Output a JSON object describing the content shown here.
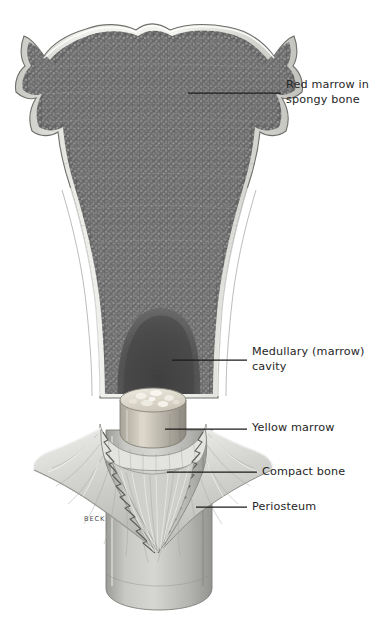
{
  "figure": {
    "background_color": "#ffffff",
    "label_color": "#262626",
    "leader_color": "#1a1a1a",
    "artist_signature": "BECK"
  },
  "labels": [
    {
      "id": "red-marrow",
      "text": "Red marrow in\nspongy bone",
      "x": 286,
      "y": 78,
      "leader": {
        "x1": 188,
        "y1": 93,
        "x2": 281,
        "y2": 93
      }
    },
    {
      "id": "medullary-cavity",
      "text": "Medullary (marrow)\ncavity",
      "x": 252,
      "y": 345,
      "leader": {
        "x1": 172,
        "y1": 360,
        "x2": 247,
        "y2": 360
      }
    },
    {
      "id": "yellow-marrow",
      "text": "Yellow marrow",
      "x": 252,
      "y": 421,
      "leader": {
        "x1": 165,
        "y1": 429,
        "x2": 247,
        "y2": 429
      }
    },
    {
      "id": "compact-bone",
      "text": "Compact bone",
      "x": 262,
      "y": 465,
      "leader": {
        "x1": 167,
        "y1": 472,
        "x2": 257,
        "y2": 472
      }
    },
    {
      "id": "periosteum",
      "text": "Periosteum",
      "x": 252,
      "y": 500,
      "leader": {
        "x1": 196,
        "y1": 507,
        "x2": 247,
        "y2": 507
      }
    }
  ],
  "anatomy": {
    "epiphysis": {
      "name": "Epiphysis with spongy bone and red marrow",
      "fill": "#6e6e6e"
    },
    "cortex": {
      "name": "Compact bone cortical shell",
      "fill": "#dcdcd8"
    },
    "medullary_cavity": {
      "name": "Medullary cavity",
      "fill": "#4d4d4d"
    },
    "yellow_marrow_plug": {
      "name": "Yellow marrow cut cylinder",
      "fill": "#d7d3c9"
    },
    "periosteum_flap": {
      "name": "Peeled periosteum membrane flap",
      "fill": "#d9d9d6"
    },
    "diaphysis": {
      "name": "Diaphysis shaft",
      "fill": "#b6b6b2"
    }
  }
}
